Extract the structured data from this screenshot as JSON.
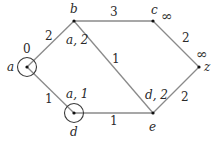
{
  "graph": {
    "title": "",
    "nodes": [
      {
        "id": "a",
        "label": "a",
        "x": 27,
        "y": 67,
        "dist": "0",
        "circled": true
      },
      {
        "id": "b",
        "label": "b",
        "x": 74,
        "y": 21,
        "dist": "a, 2",
        "circled": false
      },
      {
        "id": "c",
        "label": "c",
        "x": 153,
        "y": 21,
        "dist": "∞",
        "circled": false
      },
      {
        "id": "z",
        "label": "z",
        "x": 199,
        "y": 67,
        "dist": "∞",
        "circled": false
      },
      {
        "id": "d",
        "label": "d",
        "x": 74,
        "y": 113,
        "dist": "a, 1",
        "circled": true
      },
      {
        "id": "e",
        "label": "e",
        "x": 153,
        "y": 113,
        "dist": "d, 2",
        "circled": false
      }
    ],
    "edges": [
      {
        "from": "a",
        "to": "b",
        "weight": "2"
      },
      {
        "from": "b",
        "to": "c",
        "weight": "3"
      },
      {
        "from": "c",
        "to": "z",
        "weight": "2"
      },
      {
        "from": "a",
        "to": "d",
        "weight": "1"
      },
      {
        "from": "d",
        "to": "e",
        "weight": "1"
      },
      {
        "from": "e",
        "to": "z",
        "weight": "2"
      },
      {
        "from": "b",
        "to": "e",
        "weight": "1"
      }
    ]
  }
}
